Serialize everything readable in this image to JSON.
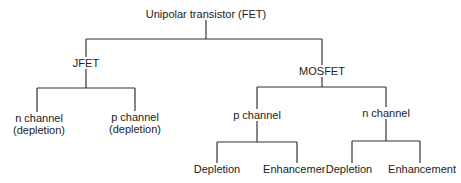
{
  "diagram": {
    "type": "tree",
    "title": "Unipolar transistor (FET)",
    "line_color": "#333333",
    "nodes": {
      "root": {
        "label": "Unipolar transistor (FET)"
      },
      "jfet": {
        "label": "JFET"
      },
      "mosfet": {
        "label": "MOSFET"
      },
      "jfet_n": {
        "label_line1": "n channel",
        "label_line2": "(depletion)"
      },
      "jfet_p": {
        "label_line1": "p channel",
        "label_line2": "(depletion)"
      },
      "mos_p": {
        "label": "p channel"
      },
      "mos_n": {
        "label": "n channel"
      },
      "mos_p_depletion": {
        "label": "Depletion"
      },
      "mos_p_enhancement": {
        "label": "Enhancement"
      },
      "mos_n_depletion": {
        "label": "Depletion"
      },
      "mos_n_enhancement": {
        "label": "Enhancement"
      }
    },
    "edges": [
      [
        "root",
        "jfet"
      ],
      [
        "root",
        "mosfet"
      ],
      [
        "jfet",
        "jfet_n"
      ],
      [
        "jfet",
        "jfet_p"
      ],
      [
        "mosfet",
        "mos_p"
      ],
      [
        "mosfet",
        "mos_n"
      ],
      [
        "mos_p",
        "mos_p_depletion"
      ],
      [
        "mos_p",
        "mos_p_enhancement"
      ],
      [
        "mos_n",
        "mos_n_depletion"
      ],
      [
        "mos_n",
        "mos_n_enhancement"
      ]
    ]
  }
}
